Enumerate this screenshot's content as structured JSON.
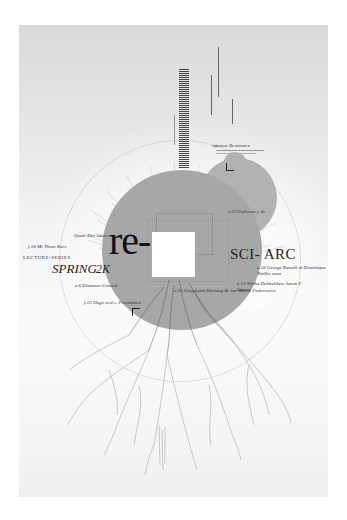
{
  "poster": {
    "headline": "re-",
    "institution": "SCI- ARC",
    "series": "LECTURE-SERIES",
    "season": "SPRING",
    "year": "2K",
    "header_caption": "reference: Re-current-a",
    "colors": {
      "background": "#ffffff",
      "paper": "#e8e8e8",
      "big_circle": "#a7a7a7",
      "small_circle": "#b2b2b2",
      "text": "#1a1a1a"
    }
  },
  "speakers": [
    {
      "label": "Quatr Dev Ideas et",
      "position": "left-upper"
    },
    {
      "label": "f.14 Mr Thom Kerz",
      "position": "left"
    },
    {
      "label": "e.6 Ebenezer Conard",
      "position": "left-lower"
    },
    {
      "label": "f.23 Hugo m.d.s. Providence",
      "position": "left-bottom"
    },
    {
      "label": "e.13 Padovan y de",
      "position": "right-upper"
    },
    {
      "label": "e.18 George Ranalli et Dominique Weilbo area",
      "position": "right"
    },
    {
      "label": "e.19 Winka Dubbeldam Aaron F. Sprenz",
      "position": "right-middle"
    },
    {
      "label": "e.25 Greg Lynn Hartung & Ann Marie Fedorowicz",
      "position": "center-bottom"
    }
  ]
}
